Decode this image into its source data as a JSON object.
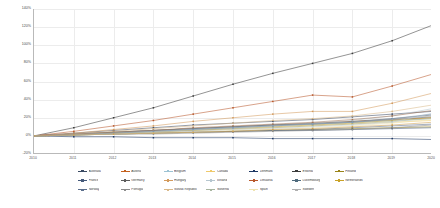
{
  "chart_data": {
    "type": "line",
    "title": "",
    "subtitle": "",
    "xlabel": "",
    "ylabel": "",
    "ylim": [
      -20,
      140
    ],
    "xlim": [
      0,
      10
    ],
    "grid": true,
    "legend_position": "bottom",
    "yticks": [
      "140%",
      "120%",
      "100%",
      "80%",
      "60%",
      "40%",
      "20%",
      "0%",
      "-20%"
    ],
    "ytick_values": [
      140,
      120,
      100,
      80,
      60,
      40,
      20,
      0,
      -20
    ],
    "categories": [
      "2010",
      "2011",
      "2012",
      "2013",
      "2014",
      "2015",
      "2016",
      "2017",
      "2018",
      "2019",
      "2020"
    ],
    "x": [
      0,
      1,
      2,
      3,
      4,
      5,
      6,
      7,
      8,
      9,
      10
    ],
    "xticks_shown": [
      "2010",
      "2011",
      "2012",
      "2013",
      "2014",
      "2015",
      "2016",
      "2017",
      "2018",
      "2019",
      "2020"
    ],
    "series": [
      {
        "name": "Australia",
        "color": "#3a4a63",
        "values": [
          0,
          3,
          6,
          9,
          12,
          14,
          16,
          18,
          21,
          24,
          27
        ]
      },
      {
        "name": "Austria",
        "color": "#c4611f",
        "values": [
          0,
          2,
          4,
          6,
          8,
          10,
          12,
          14,
          16,
          18,
          20
        ]
      },
      {
        "name": "Belgium",
        "color": "#9dc3d4",
        "values": [
          0,
          2,
          3,
          5,
          7,
          9,
          11,
          13,
          15,
          17,
          19
        ]
      },
      {
        "name": "Canada",
        "color": "#efc96b",
        "values": [
          0,
          1,
          3,
          4,
          6,
          7,
          9,
          11,
          13,
          15,
          17
        ]
      },
      {
        "name": "Denmark",
        "color": "#1f3864",
        "values": [
          0,
          -1,
          -1,
          -2,
          -2,
          -2,
          -3,
          -3,
          -3,
          -3,
          -4
        ]
      },
      {
        "name": "Estonia",
        "color": "#3b3b3b",
        "values": [
          0,
          9,
          20,
          31,
          44,
          57,
          69,
          80,
          91,
          105,
          122
        ]
      },
      {
        "name": "Finland",
        "color": "#9a8419",
        "values": [
          0,
          1,
          2,
          3,
          4,
          5,
          6,
          7,
          8,
          9,
          10
        ]
      },
      {
        "name": "France",
        "color": "#44597a",
        "values": [
          0,
          1,
          2,
          3,
          4,
          5,
          6,
          6,
          7,
          8,
          9
        ]
      },
      {
        "name": "Germany",
        "color": "#5c5c5c",
        "values": [
          0,
          2,
          4,
          6,
          8,
          10,
          12,
          14,
          16,
          19,
          23
        ]
      },
      {
        "name": "Hungary",
        "color": "#d39a5c",
        "values": [
          0,
          3,
          7,
          11,
          16,
          20,
          24,
          27,
          27,
          36,
          47
        ]
      },
      {
        "name": "Iceland",
        "color": "#b6c6cf",
        "values": [
          0,
          2,
          4,
          6,
          8,
          10,
          12,
          14,
          17,
          22,
          30
        ]
      },
      {
        "name": "Lithuania",
        "color": "#b8572a",
        "values": [
          0,
          5,
          11,
          17,
          24,
          31,
          38,
          45,
          43,
          55,
          68
        ]
      },
      {
        "name": "Luxembourg",
        "color": "#4f6b7d",
        "values": [
          0,
          2,
          4,
          6,
          8,
          10,
          12,
          13,
          15,
          18,
          21
        ]
      },
      {
        "name": "Netherlands",
        "color": "#c9a227",
        "values": [
          0,
          1,
          3,
          4,
          6,
          8,
          10,
          12,
          14,
          17,
          20
        ]
      },
      {
        "name": "Norway",
        "color": "#5b6e8c",
        "values": [
          0,
          1,
          2,
          3,
          4,
          5,
          6,
          7,
          9,
          11,
          13
        ]
      },
      {
        "name": "Portugal",
        "color": "#8c8c8c",
        "values": [
          0,
          1,
          2,
          2,
          3,
          4,
          5,
          6,
          7,
          9,
          12
        ]
      },
      {
        "name": "Slovak Republic",
        "color": "#d9b98a",
        "values": [
          0,
          2,
          5,
          8,
          11,
          14,
          17,
          19,
          22,
          27,
          34
        ]
      },
      {
        "name": "Slovenia",
        "color": "#a8b5a0",
        "values": [
          0,
          1,
          3,
          4,
          6,
          8,
          9,
          11,
          13,
          16,
          19
        ]
      },
      {
        "name": "Spain",
        "color": "#efe3b0",
        "values": [
          0,
          1,
          2,
          3,
          4,
          6,
          7,
          9,
          11,
          14,
          18
        ]
      },
      {
        "name": "Sweden",
        "color": "#b0b0b0",
        "values": [
          0,
          2,
          3,
          5,
          7,
          9,
          11,
          13,
          15,
          18,
          22
        ]
      },
      {
        "name": "Series 21",
        "color": "#c2d0d8",
        "values": [
          0,
          1,
          2,
          4,
          5,
          7,
          8,
          10,
          12,
          15,
          25
        ]
      },
      {
        "name": "Series 22",
        "color": "#a3785a",
        "values": [
          0,
          2,
          4,
          6,
          9,
          11,
          13,
          15,
          18,
          22,
          28
        ]
      },
      {
        "name": "Series 23",
        "color": "#7d9bb5",
        "values": [
          0,
          1,
          3,
          5,
          7,
          9,
          11,
          13,
          15,
          19,
          24
        ]
      },
      {
        "name": "Series 24",
        "color": "#cfa04e",
        "values": [
          0,
          1,
          2,
          3,
          4,
          5,
          7,
          8,
          10,
          12,
          15
        ]
      }
    ]
  },
  "legend": {
    "rows": [
      [
        {
          "label": "Australia",
          "color": "#3a4a63"
        },
        {
          "label": "Austria",
          "color": "#c4611f"
        },
        {
          "label": "Belgium",
          "color": "#9dc3d4"
        },
        {
          "label": "Canada",
          "color": "#efc96b"
        },
        {
          "label": "Denmark",
          "color": "#1f3864"
        },
        {
          "label": "Estonia",
          "color": "#3b3b3b"
        },
        {
          "label": "Finland",
          "color": "#9a8419"
        }
      ],
      [
        {
          "label": "France",
          "color": "#44597a"
        },
        {
          "label": "Germany",
          "color": "#5c5c5c"
        },
        {
          "label": "Hungary",
          "color": "#d39a5c"
        },
        {
          "label": "Iceland",
          "color": "#b6c6cf"
        },
        {
          "label": "Lithuania",
          "color": "#b8572a"
        },
        {
          "label": "Luxembourg",
          "color": "#4f6b7d"
        },
        {
          "label": "Netherlands",
          "color": "#c9a227"
        }
      ],
      [
        {
          "label": "Norway",
          "color": "#5b6e8c"
        },
        {
          "label": "Portugal",
          "color": "#8c8c8c"
        },
        {
          "label": "Slovak Republic",
          "color": "#d9b98a"
        },
        {
          "label": "Slovenia",
          "color": "#a8b5a0"
        },
        {
          "label": "Spain",
          "color": "#efe3b0"
        },
        {
          "label": "Sweden",
          "color": "#b0b0b0"
        }
      ]
    ]
  },
  "colors": {
    "grid": "#ececec",
    "axis": "#b9b9b9",
    "tick_text": "#4a4a4a",
    "legend_text": "#3d3d3d",
    "background": "#ffffff"
  }
}
